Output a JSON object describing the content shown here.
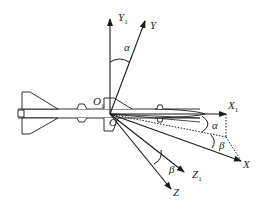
{
  "diagram": {
    "type": "coordinate-frame-diagram",
    "origin_labels": {
      "o1": "O",
      "o1_sub": "1",
      "o": "O"
    },
    "axes": [
      {
        "id": "Y1",
        "label": "Y",
        "sub": "1",
        "style": "solid"
      },
      {
        "id": "Y",
        "label": "Y",
        "sub": "",
        "style": "solid"
      },
      {
        "id": "X1",
        "label": "X",
        "sub": "1",
        "style": "solid"
      },
      {
        "id": "X",
        "label": "X",
        "sub": "",
        "style": "solid"
      },
      {
        "id": "Z1",
        "label": "Z",
        "sub": "1",
        "style": "solid"
      },
      {
        "id": "Z",
        "label": "Z",
        "sub": "",
        "style": "solid"
      }
    ],
    "angles": [
      {
        "id": "alpha_top",
        "symbol": "α",
        "between": [
          "Y1",
          "Y"
        ]
      },
      {
        "id": "alpha_right",
        "symbol": "α",
        "between": [
          "X1",
          "projection"
        ]
      },
      {
        "id": "beta_right",
        "symbol": "β",
        "between": [
          "projection",
          "X"
        ]
      },
      {
        "id": "beta_bottom",
        "symbol": "β",
        "between": [
          "Z1",
          "Z"
        ]
      }
    ],
    "colors": {
      "line": "#1a1a1a",
      "background": "#ffffff"
    }
  }
}
